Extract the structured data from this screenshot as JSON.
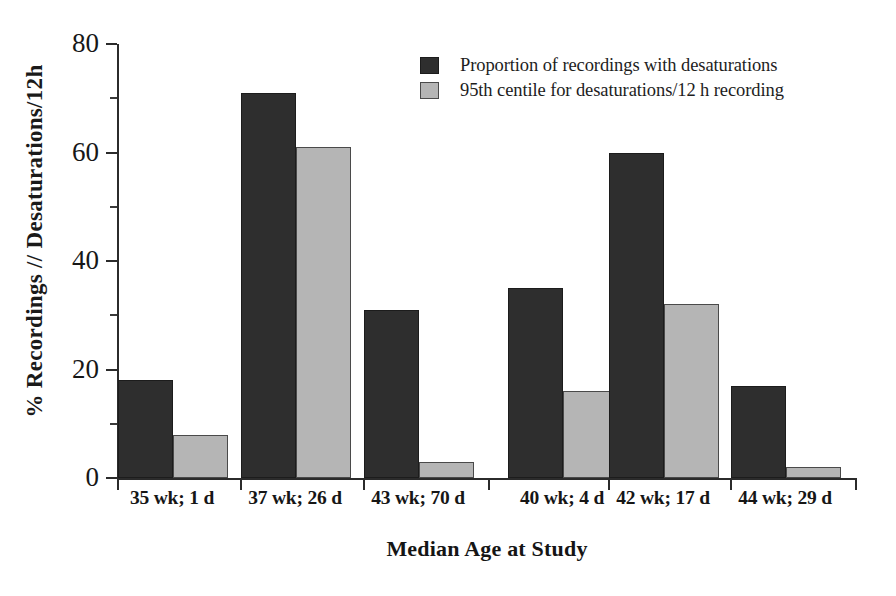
{
  "chart_data": {
    "type": "bar",
    "title": "",
    "subtitle": "",
    "xlabel": "Median Age at Study",
    "ylabel": "% Recordings // Desaturations/12h",
    "categories": [
      "35 wk; 1 d",
      "37 wk; 26 d",
      "43 wk; 70 d",
      "40 wk; 4 d",
      "42 wk; 17 d",
      "44 wk; 29 d"
    ],
    "series": [
      {
        "name": "Proportion of recordings with desaturations",
        "color": "#2e2e2e",
        "values": [
          18,
          71,
          31,
          35,
          60,
          17
        ]
      },
      {
        "name": "95th centile for desaturations/12 h recording",
        "color": "#b5b5b5",
        "values": [
          8,
          61,
          3,
          16,
          32,
          2
        ]
      }
    ],
    "ylim": [
      0,
      80
    ],
    "yticks": [
      0,
      20,
      40,
      60,
      80
    ],
    "ytick_labels": [
      "0",
      "20",
      "40",
      "60",
      "80"
    ],
    "yticks_minor": [
      10,
      30,
      50,
      70
    ],
    "grid": false,
    "legend_position": "top-right",
    "annotations": []
  },
  "legend": {
    "entries": [
      {
        "label": "Proportion of recordings with desaturations",
        "swatch": "dark-square-swatch"
      },
      {
        "label": "95th centile for desaturations/12 h recording",
        "swatch": "light-gray-square-swatch"
      }
    ]
  },
  "axes": {
    "y_title": "% Recordings // Desaturations/12h",
    "x_title": "Median Age at Study"
  }
}
